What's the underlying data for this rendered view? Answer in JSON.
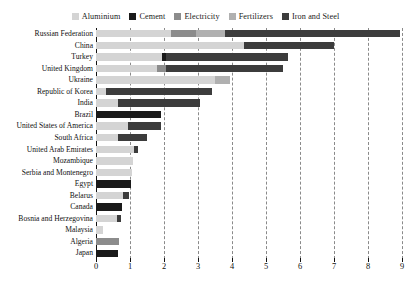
{
  "chart_data": {
    "type": "bar",
    "orientation": "horizontal",
    "stacked": true,
    "title": "",
    "subtitle": "",
    "xlabel": "",
    "ylabel": "",
    "xlim": [
      0,
      9
    ],
    "xticks": [
      0,
      1,
      2,
      3,
      4,
      5,
      6,
      7,
      8,
      9
    ],
    "xtick_labels": [
      "0",
      "1",
      "2",
      "3",
      "4",
      "5",
      "6",
      "7",
      "8",
      "9"
    ],
    "grid": "vertical-dashed",
    "legend_position": "top-center",
    "legend": [
      "Aluminium",
      "Cement",
      "Electricity",
      "Fertilizers",
      "Iron and Steel"
    ],
    "colors": {
      "Aluminium": "#d4d4d4",
      "Cement": "#1a1a1a",
      "Electricity": "#8c8c8c",
      "Fertilizers": "#b0b0b0",
      "Iron and Steel": "#3c3c3c"
    },
    "categories": [
      "Russian Federation",
      "China",
      "Turkey",
      "United Kingdom",
      "Ukraine",
      "Republic of Korea",
      "India",
      "Brazil",
      "United States of America",
      "South Africa",
      "United Arab Emirates",
      "Mozambique",
      "Serbia and Montenegro",
      "Egypt",
      "Belarus",
      "Canada",
      "Bosnia and Herzegovina",
      "Malaysia",
      "Algeria",
      "Japan"
    ],
    "series": [
      {
        "name": "Aluminium",
        "values": [
          2.2,
          4.35,
          1.95,
          1.8,
          3.5,
          0.3,
          0.65,
          0.0,
          0.95,
          0.65,
          1.12,
          1.1,
          1.05,
          0.0,
          0.78,
          0.0,
          0.62,
          0.22,
          0.0,
          0.0
        ]
      },
      {
        "name": "Cement",
        "values": [
          0.0,
          0.0,
          0.1,
          0.0,
          0.0,
          0.0,
          0.0,
          1.9,
          0.0,
          0.0,
          0.0,
          0.0,
          0.0,
          1.02,
          0.0,
          0.76,
          0.0,
          0.0,
          0.0,
          0.65
        ]
      },
      {
        "name": "Electricity",
        "values": [
          0.75,
          0.0,
          0.0,
          0.25,
          0.0,
          0.0,
          0.0,
          0.0,
          0.0,
          0.0,
          0.0,
          0.0,
          0.0,
          0.0,
          0.0,
          0.0,
          0.0,
          0.0,
          0.68,
          0.0
        ]
      },
      {
        "name": "Fertilizers",
        "values": [
          0.85,
          0.0,
          0.0,
          0.0,
          0.45,
          0.0,
          0.0,
          0.0,
          0.0,
          0.0,
          0.0,
          0.0,
          0.0,
          0.0,
          0.0,
          0.0,
          0.0,
          0.0,
          0.0,
          0.0
        ]
      },
      {
        "name": "Iron and Steel",
        "values": [
          5.15,
          2.65,
          3.6,
          3.45,
          0.0,
          3.1,
          2.4,
          0.0,
          0.95,
          0.85,
          0.13,
          0.0,
          0.0,
          0.0,
          0.2,
          0.0,
          0.12,
          0.0,
          0.0,
          0.0
        ]
      }
    ],
    "totals": [
      8.95,
      7.0,
      5.65,
      5.5,
      3.95,
      3.4,
      3.05,
      1.9,
      1.9,
      1.5,
      1.25,
      1.1,
      1.05,
      1.02,
      0.98,
      0.76,
      0.74,
      0.22,
      0.68,
      0.65
    ]
  }
}
